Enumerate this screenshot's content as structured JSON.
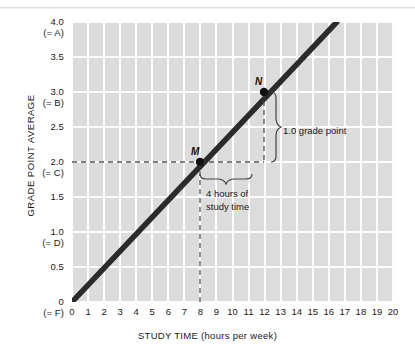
{
  "chart_data": {
    "type": "line",
    "title": "",
    "xlabel": "STUDY TIME (hours per week)",
    "ylabel": "GRADE POINT AVERAGE",
    "xlim": [
      0,
      20
    ],
    "ylim": [
      0,
      4.0
    ],
    "grid": true,
    "legend": "none",
    "series": [
      {
        "name": "GPA vs study time",
        "x": [
          0,
          16.5
        ],
        "y": [
          0.0,
          4.0
        ],
        "style": "solid-thick-black",
        "slope": 0.25,
        "intercept": 0.0
      }
    ],
    "x_ticks": [
      "0",
      "1",
      "2",
      "3",
      "4",
      "5",
      "6",
      "7",
      "8",
      "9",
      "10",
      "11",
      "12",
      "13",
      "14",
      "15",
      "16",
      "17",
      "18",
      "19",
      "20"
    ],
    "y_ticks": [
      {
        "value": "4.0",
        "grade": "(= A)"
      },
      {
        "value": "3.5",
        "grade": ""
      },
      {
        "value": "3.0",
        "grade": "(= B)"
      },
      {
        "value": "2.5",
        "grade": ""
      },
      {
        "value": "2.0",
        "grade": "(= C)"
      },
      {
        "value": "1.5",
        "grade": ""
      },
      {
        "value": "1.0",
        "grade": "(= D)"
      },
      {
        "value": "0.5",
        "grade": ""
      },
      {
        "value": "0",
        "grade": "(= F)"
      }
    ],
    "points": [
      {
        "label": "M",
        "x": 8,
        "y": 2.0
      },
      {
        "label": "N",
        "x": 12,
        "y": 3.0
      }
    ],
    "annotations": [
      {
        "name": "rise-label",
        "text": "1.0 grade point",
        "value": 1.0,
        "axis": "y"
      },
      {
        "name": "run-label-line1",
        "text": "4 hours of",
        "value": 4,
        "axis": "x"
      },
      {
        "name": "run-label-line2",
        "text": "study time",
        "value": 4,
        "axis": "x"
      }
    ],
    "colors": {
      "plot_background": "#dcdcdc",
      "gridline": "#fdfdfd",
      "line": "#2b2b2b",
      "text": "#1a1a1a",
      "dashed_guide": "#555555",
      "brace": "#444444"
    }
  }
}
